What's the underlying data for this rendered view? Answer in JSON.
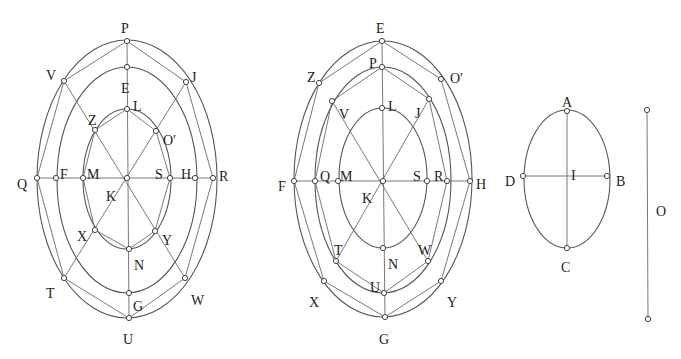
{
  "colors": {
    "background": "#ffffff",
    "stroke": "#555555",
    "text": "#222222"
  },
  "figures": [
    {
      "id": "figure-1",
      "description": "Three concentric ellipses with inscribed polygons",
      "center": {
        "label": "K",
        "x": 127,
        "y": 178
      },
      "ellipses": [
        {
          "name": "outer",
          "cx": 127,
          "cy": 179,
          "rx": 90,
          "ry": 139
        },
        {
          "name": "middle",
          "cx": 127,
          "cy": 180,
          "rx": 70,
          "ry": 113
        },
        {
          "name": "inner",
          "cx": 127,
          "cy": 179,
          "rx": 44,
          "ry": 70
        }
      ],
      "points": [
        {
          "label": "P",
          "x": 127,
          "y": 41,
          "lx": 121,
          "ly": 28
        },
        {
          "label": "E",
          "x": 127,
          "y": 67,
          "lx": 121,
          "ly": 88
        },
        {
          "label": "L",
          "x": 127,
          "y": 109,
          "lx": 133,
          "ly": 106
        },
        {
          "label": "V",
          "x": 64,
          "y": 81,
          "lx": 46,
          "ly": 75
        },
        {
          "label": "J",
          "x": 186,
          "y": 82,
          "lx": 191,
          "ly": 77
        },
        {
          "label": "Z",
          "x": 95,
          "y": 130,
          "lx": 88,
          "ly": 120
        },
        {
          "label": "O′",
          "x": 156,
          "y": 131,
          "lx": 163,
          "ly": 140
        },
        {
          "label": "Q",
          "x": 37,
          "y": 178,
          "lx": 17,
          "ly": 184
        },
        {
          "label": "F",
          "x": 56,
          "y": 178,
          "lx": 60,
          "ly": 174
        },
        {
          "label": "M",
          "x": 83,
          "y": 178,
          "lx": 87,
          "ly": 174
        },
        {
          "label": "K",
          "x": 127,
          "y": 178,
          "lx": 106,
          "ly": 196
        },
        {
          "label": "S",
          "x": 170,
          "y": 178,
          "lx": 155,
          "ly": 174
        },
        {
          "label": "H",
          "x": 195,
          "y": 178,
          "lx": 181,
          "ly": 174
        },
        {
          "label": "R",
          "x": 213,
          "y": 178,
          "lx": 219,
          "ly": 176
        },
        {
          "label": "X",
          "x": 95,
          "y": 230,
          "lx": 77,
          "ly": 236
        },
        {
          "label": "Y",
          "x": 155,
          "y": 231,
          "lx": 162,
          "ly": 240
        },
        {
          "label": "N",
          "x": 129,
          "y": 249,
          "lx": 134,
          "ly": 265
        },
        {
          "label": "T",
          "x": 64,
          "y": 278,
          "lx": 46,
          "ly": 293
        },
        {
          "label": "W",
          "x": 185,
          "y": 278,
          "lx": 191,
          "ly": 300
        },
        {
          "label": "G",
          "x": 129,
          "y": 293,
          "lx": 133,
          "ly": 306
        },
        {
          "label": "U",
          "x": 129,
          "y": 318,
          "lx": 123,
          "ly": 339
        }
      ],
      "segments": [
        [
          "P",
          "U"
        ],
        [
          "Q",
          "R"
        ],
        [
          "V",
          "W"
        ],
        [
          "J",
          "T"
        ],
        [
          "P",
          "V"
        ],
        [
          "P",
          "J"
        ],
        [
          "V",
          "Q"
        ],
        [
          "J",
          "R"
        ],
        [
          "Q",
          "T"
        ],
        [
          "R",
          "W"
        ],
        [
          "T",
          "U"
        ],
        [
          "W",
          "U"
        ],
        [
          "L",
          "Z"
        ],
        [
          "L",
          "O′"
        ],
        [
          "Z",
          "M"
        ],
        [
          "O′",
          "S"
        ],
        [
          "M",
          "X"
        ],
        [
          "S",
          "Y"
        ],
        [
          "X",
          "N"
        ],
        [
          "Y",
          "N"
        ]
      ]
    },
    {
      "id": "figure-2",
      "description": "Three concentric ellipses with inscribed polygons (relabeled)",
      "center": {
        "label": "K",
        "x": 383,
        "y": 181
      },
      "ellipses": [
        {
          "name": "outer",
          "cx": 383,
          "cy": 179,
          "rx": 89,
          "ry": 138
        },
        {
          "name": "middle",
          "cx": 383,
          "cy": 180,
          "rx": 68,
          "ry": 113
        },
        {
          "name": "inner",
          "cx": 383,
          "cy": 178,
          "rx": 44,
          "ry": 70
        }
      ],
      "points": [
        {
          "label": "E",
          "x": 382,
          "y": 41,
          "lx": 376,
          "ly": 28
        },
        {
          "label": "P",
          "x": 382,
          "y": 67,
          "lx": 369,
          "ly": 63
        },
        {
          "label": "L",
          "x": 382,
          "y": 108,
          "lx": 388,
          "ly": 106
        },
        {
          "label": "Z",
          "x": 319,
          "y": 83,
          "lx": 307,
          "ly": 77
        },
        {
          "label": "O′",
          "x": 441,
          "y": 79,
          "lx": 450,
          "ly": 78
        },
        {
          "label": "V",
          "x": 332,
          "y": 101,
          "lx": 339,
          "ly": 114
        },
        {
          "label": "J",
          "x": 429,
          "y": 99,
          "lx": 415,
          "ly": 113
        },
        {
          "label": "F",
          "x": 294,
          "y": 181,
          "lx": 278,
          "ly": 186
        },
        {
          "label": "Q",
          "x": 315,
          "y": 181,
          "lx": 320,
          "ly": 176
        },
        {
          "label": "M",
          "x": 338,
          "y": 181,
          "lx": 340,
          "ly": 176
        },
        {
          "label": "K",
          "x": 383,
          "y": 181,
          "lx": 362,
          "ly": 198
        },
        {
          "label": "S",
          "x": 427,
          "y": 181,
          "lx": 413,
          "ly": 176
        },
        {
          "label": "R",
          "x": 447,
          "y": 181,
          "lx": 434,
          "ly": 176
        },
        {
          "label": "H",
          "x": 470,
          "y": 181,
          "lx": 476,
          "ly": 184
        },
        {
          "label": "T",
          "x": 336,
          "y": 261,
          "lx": 334,
          "ly": 250
        },
        {
          "label": "W",
          "x": 428,
          "y": 261,
          "lx": 418,
          "ly": 250
        },
        {
          "label": "N",
          "x": 383,
          "y": 248,
          "lx": 388,
          "ly": 264
        },
        {
          "label": "X",
          "x": 324,
          "y": 281,
          "lx": 309,
          "ly": 302
        },
        {
          "label": "Y",
          "x": 441,
          "y": 281,
          "lx": 447,
          "ly": 302
        },
        {
          "label": "U",
          "x": 384,
          "y": 293,
          "lx": 370,
          "ly": 287
        },
        {
          "label": "G",
          "x": 385,
          "y": 317,
          "lx": 379,
          "ly": 339
        }
      ],
      "segments": [
        [
          "E",
          "G"
        ],
        [
          "F",
          "H"
        ],
        [
          "V",
          "W"
        ],
        [
          "J",
          "T"
        ],
        [
          "E",
          "Z"
        ],
        [
          "E",
          "O′"
        ],
        [
          "Z",
          "F"
        ],
        [
          "O′",
          "H"
        ],
        [
          "F",
          "X"
        ],
        [
          "H",
          "Y"
        ],
        [
          "X",
          "G"
        ],
        [
          "Y",
          "G"
        ],
        [
          "P",
          "V"
        ],
        [
          "P",
          "J"
        ],
        [
          "V",
          "Q"
        ],
        [
          "J",
          "R"
        ],
        [
          "Q",
          "T"
        ],
        [
          "R",
          "W"
        ],
        [
          "T",
          "U"
        ],
        [
          "W",
          "U"
        ]
      ]
    },
    {
      "id": "figure-3",
      "description": "Single ellipse with axes",
      "center": {
        "label": "I",
        "x": 567,
        "y": 176
      },
      "ellipses": [
        {
          "name": "ellipse",
          "cx": 567,
          "cy": 179,
          "rx": 43,
          "ry": 69
        }
      ],
      "points": [
        {
          "label": "A",
          "x": 567,
          "y": 111,
          "lx": 562,
          "ly": 102
        },
        {
          "label": "C",
          "x": 567,
          "y": 248,
          "lx": 561,
          "ly": 267
        },
        {
          "label": "D",
          "x": 523,
          "y": 176,
          "lx": 505,
          "ly": 181
        },
        {
          "label": "B",
          "x": 607,
          "y": 176,
          "lx": 616,
          "ly": 181
        },
        {
          "label": "I",
          "x": 567,
          "y": 176,
          "lx": 571,
          "ly": 175,
          "hide_dot": true
        }
      ],
      "segments": [
        [
          "A",
          "C"
        ],
        [
          "D",
          "B"
        ]
      ]
    },
    {
      "id": "figure-4",
      "description": "Standalone line segment O",
      "line": {
        "x1": 647,
        "y1": 110,
        "x2": 648,
        "y2": 319
      },
      "label": {
        "text": "O",
        "x": 656,
        "y": 216
      }
    }
  ]
}
